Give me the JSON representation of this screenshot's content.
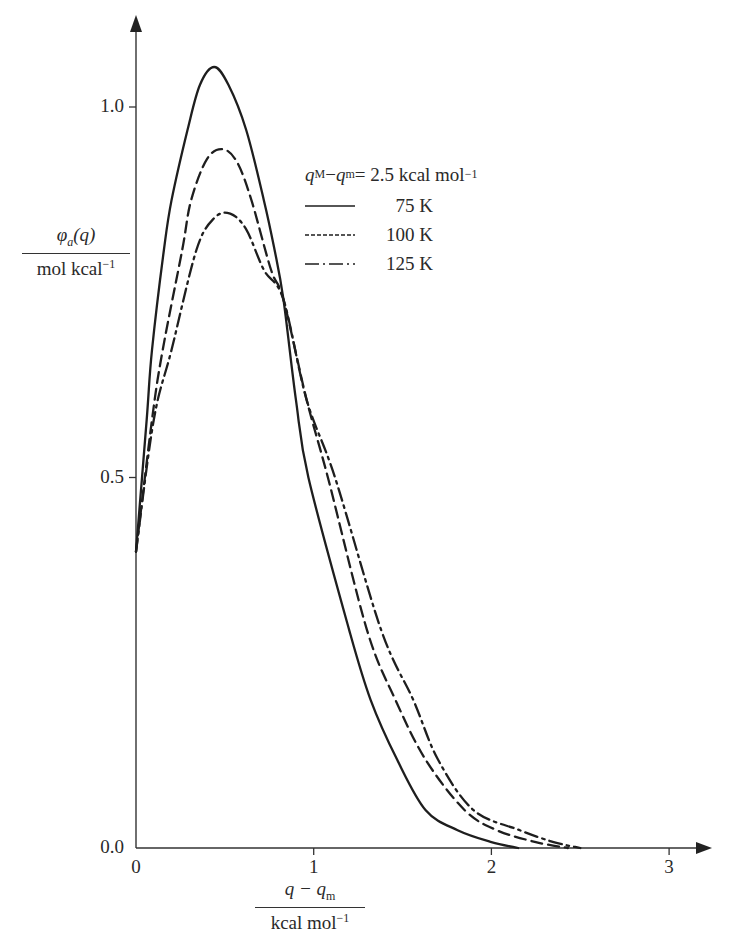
{
  "chart_data": {
    "type": "line",
    "title": "",
    "xlabel": {
      "numerator": "q − q_m",
      "denominator": "kcal mol^-1"
    },
    "ylabel": {
      "numerator": "φ_a(q)",
      "denominator": "mol kcal^-1"
    },
    "xlim": [
      0,
      3.2
    ],
    "ylim": [
      0,
      1.1
    ],
    "x_ticks": [
      0,
      1,
      2,
      3
    ],
    "x_tick_labels": [
      "0",
      "1",
      "2",
      "3"
    ],
    "y_ticks": [
      0.0,
      0.5,
      1.0
    ],
    "y_tick_labels": [
      "0.0",
      "0.5",
      "1.0"
    ],
    "grid": false,
    "legend_position": "upper right of peak",
    "legend_title": "q_M − q_m = 2.5 kcal mol^-1",
    "series": [
      {
        "name": "75 K",
        "style": "solid",
        "points": [
          [
            0,
            0.4
          ],
          [
            0.06,
            0.578
          ],
          [
            0.09,
            0.672
          ],
          [
            0.157,
            0.807
          ],
          [
            0.2,
            0.874
          ],
          [
            0.29,
            0.969
          ],
          [
            0.36,
            1.03
          ],
          [
            0.44,
            1.054
          ],
          [
            0.52,
            1.03
          ],
          [
            0.62,
            0.969
          ],
          [
            0.72,
            0.874
          ],
          [
            0.78,
            0.807
          ],
          [
            0.83,
            0.74
          ],
          [
            0.9,
            0.605
          ],
          [
            0.97,
            0.5
          ],
          [
            1.2,
            0.294
          ],
          [
            1.32,
            0.2
          ],
          [
            1.47,
            0.119
          ],
          [
            1.63,
            0.051
          ],
          [
            1.81,
            0.024
          ],
          [
            2.0,
            0.008
          ],
          [
            2.15,
            0.0
          ]
        ]
      },
      {
        "name": "100 K",
        "style": "dashed",
        "points": [
          [
            0,
            0.4
          ],
          [
            0.09,
            0.578
          ],
          [
            0.15,
            0.672
          ],
          [
            0.26,
            0.807
          ],
          [
            0.31,
            0.874
          ],
          [
            0.4,
            0.93
          ],
          [
            0.49,
            0.943
          ],
          [
            0.57,
            0.925
          ],
          [
            0.65,
            0.874
          ],
          [
            0.76,
            0.78
          ],
          [
            0.83,
            0.74
          ],
          [
            0.96,
            0.605
          ],
          [
            1.08,
            0.5
          ],
          [
            1.3,
            0.294
          ],
          [
            1.46,
            0.2
          ],
          [
            1.63,
            0.119
          ],
          [
            1.85,
            0.051
          ],
          [
            2.03,
            0.024
          ],
          [
            2.25,
            0.008
          ],
          [
            2.43,
            0.0
          ]
        ]
      },
      {
        "name": "125 K",
        "style": "dash-dot",
        "points": [
          [
            0,
            0.4
          ],
          [
            0.1,
            0.578
          ],
          [
            0.2,
            0.672
          ],
          [
            0.34,
            0.807
          ],
          [
            0.44,
            0.85
          ],
          [
            0.53,
            0.856
          ],
          [
            0.62,
            0.835
          ],
          [
            0.72,
            0.78
          ],
          [
            0.83,
            0.74
          ],
          [
            0.96,
            0.605
          ],
          [
            1.12,
            0.5
          ],
          [
            1.38,
            0.294
          ],
          [
            1.56,
            0.2
          ],
          [
            1.7,
            0.119
          ],
          [
            1.9,
            0.051
          ],
          [
            2.16,
            0.024
          ],
          [
            2.35,
            0.008
          ],
          [
            2.5,
            0.0
          ]
        ]
      }
    ]
  },
  "axes": {
    "y_num": "φ",
    "y_num_sub": "a",
    "y_num_rest": "(q)",
    "y_den": "mol kcal",
    "y_den_sup": "−1",
    "x_num": "q − q",
    "x_num_sub": "m",
    "x_den": "kcal mol",
    "x_den_sup": "−1"
  },
  "legend": {
    "title_q1": "q",
    "title_sub1": "M",
    "title_mid": " − ",
    "title_q2": "q",
    "title_sub2": "m",
    "title_rest": " = 2.5 kcal mol",
    "title_sup": "−1",
    "items": [
      {
        "label": "75 K",
        "style": "solid"
      },
      {
        "label": "100 K",
        "style": "dashed"
      },
      {
        "label": "125 K",
        "style": "dash-dot"
      }
    ]
  },
  "colors": {
    "line": "#1e1e1e",
    "axis": "#333333",
    "background": "#ffffff"
  }
}
